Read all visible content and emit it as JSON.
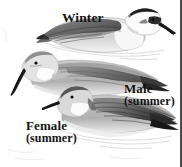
{
  "plate": {
    "kind": "field-guide-illustration",
    "subject": "phalarope plumages",
    "background_color": "#ffffff",
    "ink_color": "#141414",
    "border_color": "#4a4a4a",
    "width": 182,
    "height": 167
  },
  "labels": {
    "winter": "Winter",
    "male_line1": "Male",
    "male_line2": "(summer)",
    "female_line1": "Female",
    "female_line2": "(summer)"
  },
  "birds": [
    {
      "id": "winter-bird",
      "label": "Winter",
      "facing": "right",
      "posture": "swimming",
      "head_pattern": "white head with dark crown and dark eye stripe",
      "body_tone": "pale grey and white",
      "wing_tone": "dark grey streaked"
    },
    {
      "id": "female-summer-bird",
      "label": "Female (summer)",
      "facing": "left",
      "posture": "swimming",
      "head_pattern": "grey crown, white throat patch",
      "body_tone": "medium grey",
      "wing_tone": "grey with darker tips"
    },
    {
      "id": "male-summer-bird",
      "label": "Male (summer)",
      "facing": "left",
      "posture": "swimming",
      "head_pattern": "grey crown, white throat patch",
      "body_tone": "grey",
      "wing_tone": "dark grey barred with black tips"
    }
  ]
}
